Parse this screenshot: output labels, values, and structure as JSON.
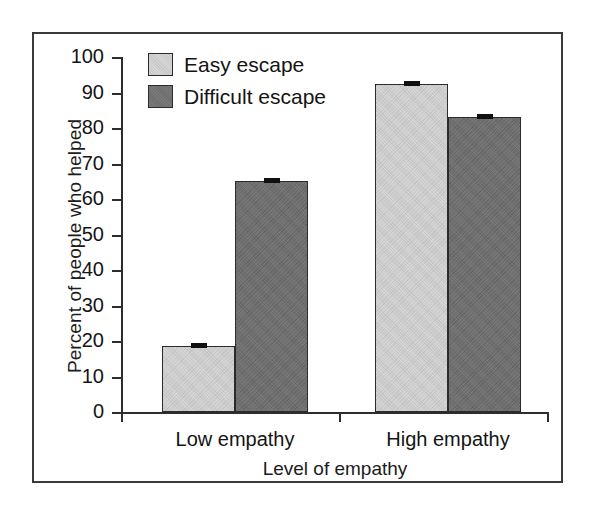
{
  "chart_data": {
    "type": "bar",
    "title": "",
    "subtitle": "",
    "xlabel": "Level of empathy",
    "ylabel": "Percent of people who helped",
    "categories": [
      "Low empathy",
      "High empathy"
    ],
    "series": [
      {
        "name": "Easy escape",
        "color": "#d6d6d6",
        "values": [
          18.5,
          92.5
        ],
        "errors": [
          1.0,
          1.0
        ]
      },
      {
        "name": "Difficult escape",
        "color": "#6e6e6e",
        "values": [
          65.0,
          83.0
        ],
        "errors": [
          1.0,
          1.0
        ]
      }
    ],
    "ylim": [
      0,
      100
    ],
    "ytick_values": [
      0,
      10,
      20,
      30,
      40,
      50,
      60,
      70,
      80,
      90,
      100
    ],
    "ytick_labels": [
      "0",
      "10",
      "20",
      "30",
      "40",
      "50",
      "60",
      "70",
      "80",
      "90",
      "100"
    ],
    "grid": false,
    "legend_position": "top-left",
    "has_error_bars": true,
    "frame": true
  },
  "legend": {
    "entries": [
      {
        "label": "Easy escape",
        "swatch": "light-gray-swatch"
      },
      {
        "label": "Difficult escape",
        "swatch": "dark-gray-swatch"
      }
    ]
  },
  "colors": {
    "bar_light": "#d6d6d6",
    "bar_dark": "#6e6e6e",
    "outline": "#2b2b2b",
    "axis": "#2d2d2d",
    "text": "#141414",
    "frame": "#3a3a3a",
    "background": "#ffffff"
  }
}
